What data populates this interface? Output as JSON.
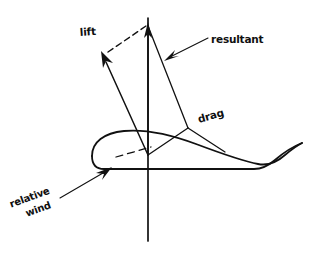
{
  "figure": {
    "type": "diagram",
    "background_color": "#ffffff",
    "ink_color": "#111111"
  },
  "labels": {
    "lift": "lift",
    "resultant": "resultant",
    "drag": "drag",
    "relative_wind_line1": "relative",
    "relative_wind_line2": "wind"
  },
  "geometry": {
    "origin": {
      "x": 148,
      "y": 155
    },
    "vertical_axis": {
      "x": 148,
      "y_top": 12,
      "y_bottom": 241
    },
    "resultant_tip": {
      "x": 148,
      "y": 25
    },
    "lift_tip": {
      "x": 103,
      "y": 55
    },
    "drag_tip": {
      "x": 188,
      "y": 128
    },
    "relative_wind_arrow": {
      "x1": 61,
      "y1": 197,
      "x2": 109,
      "y2": 169
    },
    "resultant_leader": {
      "x1": 207,
      "y1": 38,
      "x2": 167,
      "y2": 58
    },
    "chord_dash": {
      "x1": 116,
      "y1": 157,
      "x2": 151,
      "y2": 147
    }
  },
  "label_positions": {
    "lift": {
      "x": 80,
      "y": 36,
      "rotation": -4
    },
    "resultant": {
      "x": 211,
      "y": 43,
      "rotation": 0
    },
    "drag": {
      "x": 199,
      "y": 123,
      "rotation": -16
    },
    "relative_wind": {
      "x": 8,
      "y": 190,
      "rotation": -20
    }
  }
}
